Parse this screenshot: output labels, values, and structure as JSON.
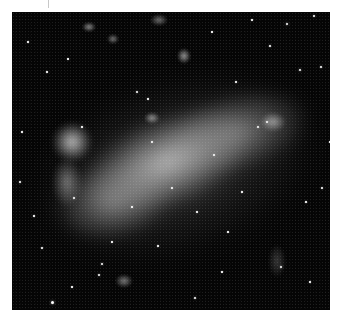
{
  "image": {
    "subject": "Large Magellanic Cloud (black-and-white astronomical photograph)",
    "background_color": "#050505",
    "border_color": "#ffffff",
    "frame": {
      "x": 12,
      "y": 12,
      "width": 318,
      "height": 298
    }
  },
  "nebulae": [
    {
      "name": "galaxy-bar-core",
      "x": 60,
      "y": 105,
      "w": 190,
      "h": 90,
      "rotate": -22,
      "color": "rgba(205,205,205,0.85)"
    },
    {
      "name": "galaxy-bar-east",
      "x": 150,
      "y": 80,
      "w": 150,
      "h": 80,
      "rotate": -15,
      "color": "rgba(170,170,170,0.6)"
    },
    {
      "name": "galaxy-bar-west",
      "x": 40,
      "y": 150,
      "w": 120,
      "h": 80,
      "rotate": -10,
      "color": "rgba(175,175,175,0.6)"
    },
    {
      "name": "galaxy-halo",
      "x": 20,
      "y": 70,
      "w": 290,
      "h": 170,
      "rotate": -18,
      "color": "rgba(110,110,110,0.45)"
    },
    {
      "name": "tarantula-region",
      "x": 40,
      "y": 110,
      "w": 40,
      "h": 40,
      "rotate": 0,
      "color": "rgba(230,230,230,0.8)"
    },
    {
      "name": "west-knots",
      "x": 40,
      "y": 145,
      "w": 30,
      "h": 50,
      "rotate": 0,
      "color": "rgba(190,190,190,0.55)"
    },
    {
      "name": "north-cluster-a",
      "x": 70,
      "y": 10,
      "w": 14,
      "h": 10,
      "rotate": 0,
      "color": "rgba(200,200,200,0.7)"
    },
    {
      "name": "north-cluster-b",
      "x": 95,
      "y": 22,
      "w": 12,
      "h": 10,
      "rotate": 0,
      "color": "rgba(200,200,200,0.6)"
    },
    {
      "name": "north-cluster-c",
      "x": 138,
      "y": 2,
      "w": 18,
      "h": 12,
      "rotate": 0,
      "color": "rgba(200,200,200,0.55)"
    },
    {
      "name": "north-cluster-d",
      "x": 165,
      "y": 36,
      "w": 14,
      "h": 16,
      "rotate": 0,
      "color": "rgba(210,210,210,0.7)"
    },
    {
      "name": "south-cluster",
      "x": 103,
      "y": 262,
      "w": 18,
      "h": 14,
      "rotate": 0,
      "color": "rgba(200,200,200,0.6)"
    },
    {
      "name": "east-knot",
      "x": 248,
      "y": 100,
      "w": 26,
      "h": 20,
      "rotate": 0,
      "color": "rgba(220,220,220,0.55)"
    },
    {
      "name": "north-knot",
      "x": 132,
      "y": 100,
      "w": 16,
      "h": 12,
      "rotate": 0,
      "color": "rgba(220,220,220,0.6)"
    },
    {
      "name": "southeast-filament",
      "x": 256,
      "y": 232,
      "w": 18,
      "h": 34,
      "rotate": 0,
      "color": "rgba(150,150,150,0.35)"
    }
  ],
  "stars": [
    {
      "x": 275,
      "y": 12,
      "r": 1.4
    },
    {
      "x": 302,
      "y": 4,
      "r": 1.0
    },
    {
      "x": 288,
      "y": 58,
      "r": 1.4
    },
    {
      "x": 309,
      "y": 55,
      "r": 1.0
    },
    {
      "x": 258,
      "y": 34,
      "r": 0.9
    },
    {
      "x": 224,
      "y": 70,
      "r": 0.8
    },
    {
      "x": 16,
      "y": 30,
      "r": 0.8
    },
    {
      "x": 35,
      "y": 60,
      "r": 0.8
    },
    {
      "x": 56,
      "y": 47,
      "r": 0.7
    },
    {
      "x": 125,
      "y": 80,
      "r": 1.0
    },
    {
      "x": 136,
      "y": 87,
      "r": 0.8
    },
    {
      "x": 8,
      "y": 170,
      "r": 0.9
    },
    {
      "x": 22,
      "y": 204,
      "r": 0.8
    },
    {
      "x": 30,
      "y": 236,
      "r": 0.9
    },
    {
      "x": 40,
      "y": 290,
      "r": 1.5
    },
    {
      "x": 90,
      "y": 252,
      "r": 1.0
    },
    {
      "x": 87,
      "y": 263,
      "r": 1.0
    },
    {
      "x": 146,
      "y": 234,
      "r": 0.8
    },
    {
      "x": 183,
      "y": 286,
      "r": 1.0
    },
    {
      "x": 269,
      "y": 255,
      "r": 1.3
    },
    {
      "x": 298,
      "y": 270,
      "r": 0.8
    },
    {
      "x": 310,
      "y": 176,
      "r": 0.9
    },
    {
      "x": 294,
      "y": 190,
      "r": 0.8
    },
    {
      "x": 255,
      "y": 110,
      "r": 1.4
    },
    {
      "x": 246,
      "y": 115,
      "r": 1.2
    },
    {
      "x": 202,
      "y": 143,
      "r": 1.0
    },
    {
      "x": 185,
      "y": 200,
      "r": 0.8
    },
    {
      "x": 216,
      "y": 220,
      "r": 0.7
    },
    {
      "x": 62,
      "y": 186,
      "r": 1.0
    },
    {
      "x": 120,
      "y": 195,
      "r": 0.8
    },
    {
      "x": 160,
      "y": 176,
      "r": 0.9
    },
    {
      "x": 230,
      "y": 180,
      "r": 0.7
    },
    {
      "x": 100,
      "y": 230,
      "r": 0.7
    },
    {
      "x": 10,
      "y": 120,
      "r": 0.7
    },
    {
      "x": 318,
      "y": 130,
      "r": 0.7
    },
    {
      "x": 200,
      "y": 20,
      "r": 0.7
    },
    {
      "x": 240,
      "y": 8,
      "r": 0.8
    },
    {
      "x": 60,
      "y": 275,
      "r": 0.7
    },
    {
      "x": 210,
      "y": 260,
      "r": 0.7
    },
    {
      "x": 140,
      "y": 130,
      "r": 0.9
    },
    {
      "x": 70,
      "y": 115,
      "r": 0.8
    }
  ]
}
